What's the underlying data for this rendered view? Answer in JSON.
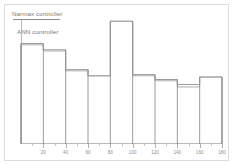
{
  "figure": {
    "background": "#ffffff",
    "frame_color": "#dcdcdc",
    "axis_color": "#b9b9b9"
  },
  "legend": {
    "position": "top-left",
    "entries": [
      {
        "label": "Narmax controller",
        "marker": "line-swatch",
        "color": "#8e8e8e"
      },
      {
        "label": "ANN controller",
        "marker": "none",
        "color": "#9a9a9a"
      }
    ]
  },
  "chart_data": {
    "type": "bar",
    "title": "",
    "subtitle": "",
    "xlabel": "",
    "ylabel": "",
    "grid": false,
    "legend_position": "top-left",
    "style": "step-outline histogram, two overlapping unfilled series",
    "bin_width": 20,
    "bin_edges": [
      0,
      20,
      40,
      60,
      80,
      100,
      120,
      140,
      160,
      180
    ],
    "categories": [
      "0-20",
      "20-40",
      "40-60",
      "60-80",
      "80-100",
      "100-120",
      "120-140",
      "140-160",
      "160-180"
    ],
    "x": [
      10,
      30,
      50,
      70,
      90,
      110,
      130,
      150,
      170
    ],
    "xlim": [
      0,
      180
    ],
    "ylim": [
      0,
      1.0
    ],
    "xtick_labels": [
      "20",
      "40",
      "60",
      "80",
      "100",
      "120",
      "140",
      "160",
      "180"
    ],
    "xtick_values": [
      20,
      40,
      60,
      80,
      100,
      120,
      140,
      160,
      180
    ],
    "xtick_minor_values": [
      10,
      30,
      50,
      70,
      90,
      110,
      130,
      150,
      170
    ],
    "ytick_labels": [],
    "series": [
      {
        "name": "Narmax controller",
        "color": "#8e8e8e",
        "values": [
          0.81,
          0.76,
          0.6,
          0.55,
          0.99,
          0.56,
          0.52,
          0.48,
          0.54
        ]
      },
      {
        "name": "ANN controller",
        "color": "#a5a5a5",
        "values": [
          0.8,
          0.75,
          0.59,
          0.55,
          0.99,
          0.55,
          0.51,
          0.46,
          0.54
        ]
      }
    ]
  }
}
